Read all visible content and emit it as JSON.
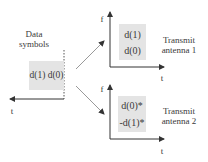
{
  "source": {
    "title_line1": "Data",
    "title_line2": "symbols",
    "symbols": "d(1) d(0)",
    "t_label": "t"
  },
  "antenna1": {
    "f_label": "f",
    "t_label": "t",
    "symbol_top": "d(1)",
    "symbol_bottom": "d(0)",
    "label_line1": "Transmit",
    "label_line2": "antenna 1"
  },
  "antenna2": {
    "f_label": "f",
    "t_label": "t",
    "symbol_top": "d(0)*",
    "symbol_bottom": "-d(1)*",
    "label_line1": "Transmit",
    "label_line2": "antenna 2"
  },
  "colors": {
    "box_fill": "#e4e4e4",
    "line": "#333333",
    "text": "#3a3a3a"
  }
}
